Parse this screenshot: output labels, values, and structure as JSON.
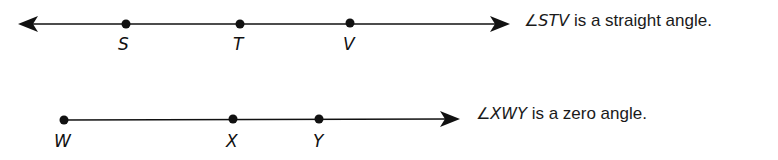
{
  "diagram": {
    "line1": {
      "type": "line",
      "description": "Line with arrows on both ends",
      "points": [
        {
          "label": "S",
          "x": 126
        },
        {
          "label": "T",
          "x": 240
        },
        {
          "label": "V",
          "x": 350
        }
      ],
      "caption": {
        "angle_symbol": "∠",
        "angle_name": "STV",
        "text": " is a straight angle."
      }
    },
    "line2": {
      "type": "ray",
      "description": "Ray from W through X and Y",
      "points": [
        {
          "label": "W",
          "x": 64
        },
        {
          "label": "X",
          "x": 233
        },
        {
          "label": "Y",
          "x": 319
        }
      ],
      "caption": {
        "angle_symbol": "∠",
        "angle_name": "XWY",
        "text": " is a zero angle."
      }
    },
    "colors": {
      "stroke": "#111111",
      "background": "#ffffff"
    }
  }
}
